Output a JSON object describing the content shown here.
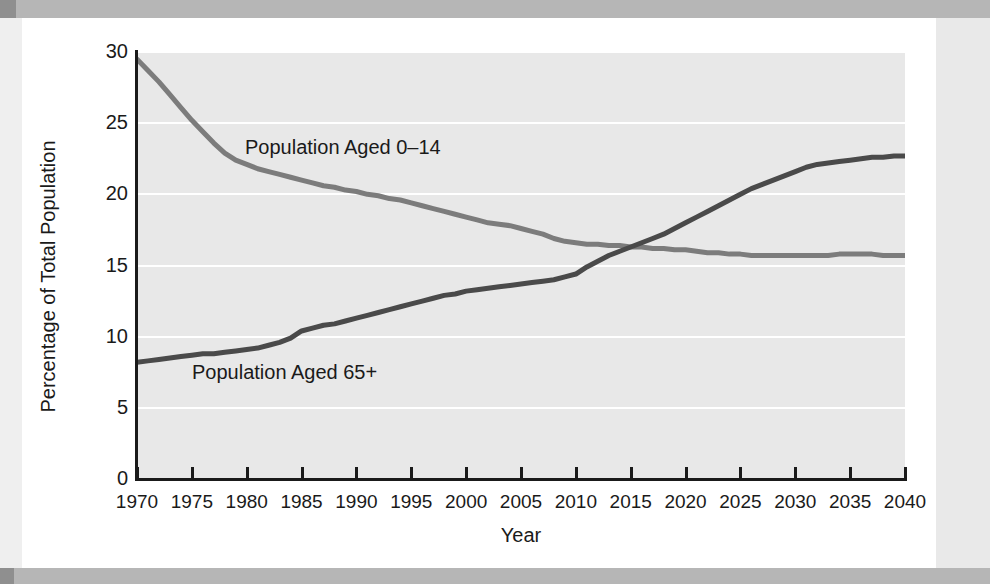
{
  "figure": {
    "plot_background": "#e8e8e8",
    "gridline_color": "#ffffff",
    "axis_color": "#1a1a1a",
    "page_band_color": "#b6b6b6"
  },
  "chart_data": {
    "type": "line",
    "title": "",
    "xlabel": "Year",
    "ylabel": "Percentage of Total Population",
    "xlim": [
      1970,
      2040
    ],
    "ylim": [
      0,
      30
    ],
    "grid": true,
    "grid_axis": "y",
    "legend": "inline-annotations",
    "xtick_labels": [
      "1970",
      "1975",
      "1980",
      "1985",
      "1990",
      "1995",
      "2000",
      "2005",
      "2010",
      "2015",
      "2020",
      "2025",
      "2030",
      "2035",
      "2040"
    ],
    "xticks": [
      1970,
      1975,
      1980,
      1985,
      1990,
      1995,
      2000,
      2005,
      2010,
      2015,
      2020,
      2025,
      2030,
      2035,
      2040
    ],
    "ytick_labels": [
      "0",
      "5",
      "10",
      "15",
      "20",
      "25",
      "30"
    ],
    "yticks": [
      0,
      5,
      10,
      15,
      20,
      25,
      30
    ],
    "x": [
      1970,
      1971,
      1972,
      1973,
      1974,
      1975,
      1976,
      1977,
      1978,
      1979,
      1980,
      1981,
      1982,
      1983,
      1984,
      1985,
      1986,
      1987,
      1988,
      1989,
      1990,
      1991,
      1992,
      1993,
      1994,
      1995,
      1996,
      1997,
      1998,
      1999,
      2000,
      2001,
      2002,
      2003,
      2004,
      2005,
      2006,
      2007,
      2008,
      2009,
      2010,
      2011,
      2012,
      2013,
      2014,
      2015,
      2016,
      2017,
      2018,
      2019,
      2020,
      2021,
      2022,
      2023,
      2024,
      2025,
      2026,
      2027,
      2028,
      2029,
      2030,
      2031,
      2032,
      2033,
      2034,
      2035,
      2036,
      2037,
      2038,
      2039,
      2040
    ],
    "series": [
      {
        "name": "Population Aged 0-14",
        "label": "Population Aged 0–14",
        "color": "#7c7c7c",
        "line_width": 5,
        "values": [
          29.5,
          28.7,
          27.9,
          27.0,
          26.1,
          25.2,
          24.4,
          23.6,
          22.9,
          22.4,
          22.1,
          21.8,
          21.6,
          21.4,
          21.2,
          21.0,
          20.8,
          20.6,
          20.5,
          20.3,
          20.2,
          20.0,
          19.9,
          19.7,
          19.6,
          19.4,
          19.2,
          19.0,
          18.8,
          18.6,
          18.4,
          18.2,
          18.0,
          17.9,
          17.8,
          17.6,
          17.4,
          17.2,
          16.9,
          16.7,
          16.6,
          16.5,
          16.5,
          16.4,
          16.4,
          16.3,
          16.3,
          16.2,
          16.2,
          16.1,
          16.1,
          16.0,
          15.9,
          15.9,
          15.8,
          15.8,
          15.7,
          15.7,
          15.7,
          15.7,
          15.7,
          15.7,
          15.7,
          15.7,
          15.8,
          15.8,
          15.8,
          15.8,
          15.7,
          15.7,
          15.7
        ]
      },
      {
        "name": "Population Aged 65+",
        "label": "Population Aged 65+",
        "color": "#4a4a4a",
        "line_width": 5,
        "values": [
          8.2,
          8.3,
          8.4,
          8.5,
          8.6,
          8.7,
          8.8,
          8.8,
          8.9,
          9.0,
          9.1,
          9.2,
          9.4,
          9.6,
          9.9,
          10.4,
          10.6,
          10.8,
          10.9,
          11.1,
          11.3,
          11.5,
          11.7,
          11.9,
          12.1,
          12.3,
          12.5,
          12.7,
          12.9,
          13.0,
          13.2,
          13.3,
          13.4,
          13.5,
          13.6,
          13.7,
          13.8,
          13.9,
          14.0,
          14.2,
          14.4,
          14.9,
          15.3,
          15.7,
          16.0,
          16.3,
          16.6,
          16.9,
          17.2,
          17.6,
          18.0,
          18.4,
          18.8,
          19.2,
          19.6,
          20.0,
          20.4,
          20.7,
          21.0,
          21.3,
          21.6,
          21.9,
          22.1,
          22.2,
          22.3,
          22.4,
          22.5,
          22.6,
          22.6,
          22.7,
          22.7
        ]
      }
    ],
    "annotations": [
      {
        "text": "Population Aged 0–14",
        "x": 1990,
        "y": 23.0
      },
      {
        "text": "Population Aged 65+",
        "x": 1986,
        "y": 7.6
      }
    ]
  }
}
